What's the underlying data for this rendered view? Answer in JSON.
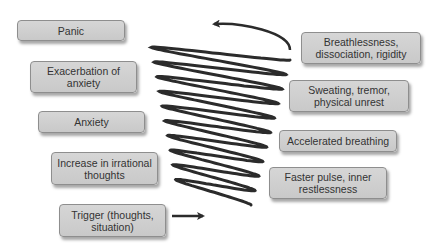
{
  "diagram": {
    "colors": {
      "box_fill": "#cfcfcf",
      "box_border": "#8e8e8e",
      "text": "#333333",
      "spiral": "#2b2b2b"
    },
    "left_boxes": [
      {
        "id": "panic",
        "label": "Panic",
        "x": 17,
        "y": 20,
        "w": 108,
        "h": 21
      },
      {
        "id": "exacerbation",
        "label": "Exacerbation of anxiety",
        "x": 30,
        "y": 61,
        "w": 107,
        "h": 32
      },
      {
        "id": "anxiety",
        "label": "Anxiety",
        "x": 38,
        "y": 111,
        "w": 107,
        "h": 22
      },
      {
        "id": "irrational-thoughts",
        "label": "Increase in irrational thoughts",
        "x": 51,
        "y": 152,
        "w": 107,
        "h": 33
      },
      {
        "id": "trigger",
        "label": "Trigger (thoughts, situation)",
        "x": 59,
        "y": 204,
        "w": 107,
        "h": 33
      }
    ],
    "right_boxes": [
      {
        "id": "breathlessness",
        "label": "Breathlessness, dissociation, rigidity",
        "x": 301,
        "y": 32,
        "w": 120,
        "h": 32
      },
      {
        "id": "sweating",
        "label": "Sweating, tremor, physical unrest",
        "x": 289,
        "y": 80,
        "w": 120,
        "h": 32
      },
      {
        "id": "accelerated-breathing",
        "label": "Accelerated breathing",
        "x": 279,
        "y": 130,
        "w": 118,
        "h": 22
      },
      {
        "id": "faster-pulse",
        "label": "Faster pulse, inner restlessness",
        "x": 269,
        "y": 167,
        "w": 118,
        "h": 32
      }
    ],
    "spiral": {
      "loops": 10,
      "top": {
        "cx": 220,
        "cy": 50,
        "rx": 70,
        "ry": 10
      },
      "bottom": {
        "cx": 214,
        "cy": 196,
        "rx": 37,
        "ry": 9
      },
      "entry_arrow": {
        "x1": 172,
        "y1": 216,
        "x2": 203,
        "y2": 216
      },
      "exit_arrow_tip": {
        "x": 214,
        "y": 24
      }
    }
  }
}
